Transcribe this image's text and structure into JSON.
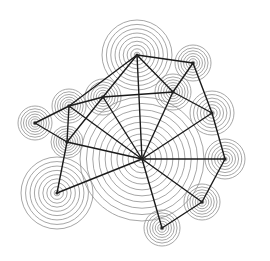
{
  "diagram": {
    "type": "network-graph",
    "style": {
      "background": "#ffffff",
      "edge_color": "#1a1a1a",
      "ring_color": "#8f8f8f",
      "node_color": "#222222"
    },
    "nodes": [
      {
        "id": "C",
        "x": 142,
        "y": 159,
        "rings": 11,
        "outer_radius": 62
      },
      {
        "id": "T",
        "x": 137,
        "y": 55,
        "rings": 9,
        "outer_radius": 35
      },
      {
        "id": "TR",
        "x": 193,
        "y": 63,
        "rings": 7,
        "outer_radius": 18
      },
      {
        "id": "MR",
        "x": 173,
        "y": 92,
        "rings": 7,
        "outer_radius": 18
      },
      {
        "id": "LU",
        "x": 103,
        "y": 97,
        "rings": 7,
        "outer_radius": 18
      },
      {
        "id": "LM",
        "x": 69,
        "y": 106,
        "rings": 7,
        "outer_radius": 17
      },
      {
        "id": "FL",
        "x": 35,
        "y": 123,
        "rings": 7,
        "outer_radius": 17
      },
      {
        "id": "LL",
        "x": 67,
        "y": 142,
        "rings": 7,
        "outer_radius": 16
      },
      {
        "id": "R",
        "x": 212,
        "y": 113,
        "rings": 7,
        "outer_radius": 22
      },
      {
        "id": "RL",
        "x": 225,
        "y": 159,
        "rings": 7,
        "outer_radius": 20
      },
      {
        "id": "BR",
        "x": 202,
        "y": 202,
        "rings": 7,
        "outer_radius": 18
      },
      {
        "id": "B",
        "x": 162,
        "y": 228,
        "rings": 7,
        "outer_radius": 18
      },
      {
        "id": "BL",
        "x": 57,
        "y": 193,
        "rings": 9,
        "outer_radius": 36
      }
    ],
    "edges": [
      [
        "T",
        "LM"
      ],
      [
        "T",
        "LU"
      ],
      [
        "T",
        "TR"
      ],
      [
        "T",
        "MR"
      ],
      [
        "T",
        "C"
      ],
      [
        "TR",
        "MR"
      ],
      [
        "TR",
        "R"
      ],
      [
        "MR",
        "R"
      ],
      [
        "MR",
        "C"
      ],
      [
        "LU",
        "MR"
      ],
      [
        "LM",
        "LU"
      ],
      [
        "FL",
        "LM"
      ],
      [
        "FL",
        "LL"
      ],
      [
        "LM",
        "LL"
      ],
      [
        "LM",
        "C"
      ],
      [
        "LU",
        "LL"
      ],
      [
        "LU",
        "C"
      ],
      [
        "LL",
        "C"
      ],
      [
        "LL",
        "BL"
      ],
      [
        "BL",
        "C"
      ],
      [
        "R",
        "RL"
      ],
      [
        "R",
        "C"
      ],
      [
        "RL",
        "C"
      ],
      [
        "RL",
        "BR"
      ],
      [
        "C",
        "BR"
      ],
      [
        "C",
        "B"
      ],
      [
        "B",
        "BR"
      ]
    ]
  }
}
